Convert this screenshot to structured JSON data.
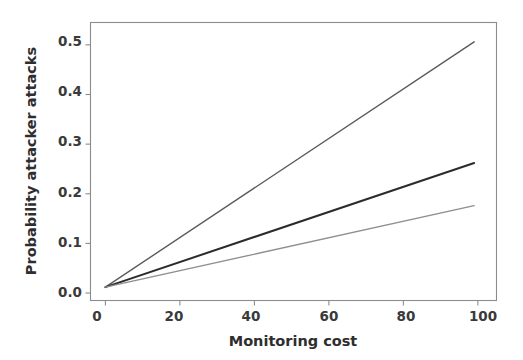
{
  "chart_data": {
    "type": "line",
    "title": "",
    "xlabel": "Monitoring cost",
    "ylabel": "Probability attacker attacks",
    "xlim": [
      -4,
      105
    ],
    "ylim": [
      -0.015,
      0.545
    ],
    "xticks": [
      0,
      20,
      40,
      60,
      80,
      100
    ],
    "xtick_labels": [
      "0",
      "20",
      "40",
      "60",
      "80",
      "100"
    ],
    "yticks": [
      0.0,
      0.1,
      0.2,
      0.3,
      0.4,
      0.5
    ],
    "ytick_labels": [
      "0.0",
      "0.1",
      "0.2",
      "0.3",
      "0.4",
      "0.5"
    ],
    "grid": false,
    "legend": "none",
    "x": [
      0,
      99
    ],
    "series": [
      {
        "name": "upper",
        "color": "#5a5a5a",
        "linewidth": 1.4,
        "values": [
          0.012,
          0.506
        ]
      },
      {
        "name": "middle",
        "color": "#2b2b2b",
        "linewidth": 2.0,
        "values": [
          0.012,
          0.262
        ]
      },
      {
        "name": "lower",
        "color": "#8f8f8f",
        "linewidth": 1.4,
        "values": [
          0.012,
          0.176
        ]
      }
    ]
  },
  "axes": {
    "spine_color": "#8c8c8c",
    "tick_color": "#8c8c8c",
    "background": "#ffffff"
  },
  "labels": {
    "x_axis_title": "Monitoring cost",
    "y_axis_title": "Probability attacker attacks",
    "ytick_0": "0.0",
    "ytick_1": "0.1",
    "ytick_2": "0.2",
    "ytick_3": "0.3",
    "ytick_4": "0.4",
    "ytick_5": "0.5",
    "xtick_0": "0",
    "xtick_1": "20",
    "xtick_2": "40",
    "xtick_3": "60",
    "xtick_4": "80",
    "xtick_5": "100"
  }
}
